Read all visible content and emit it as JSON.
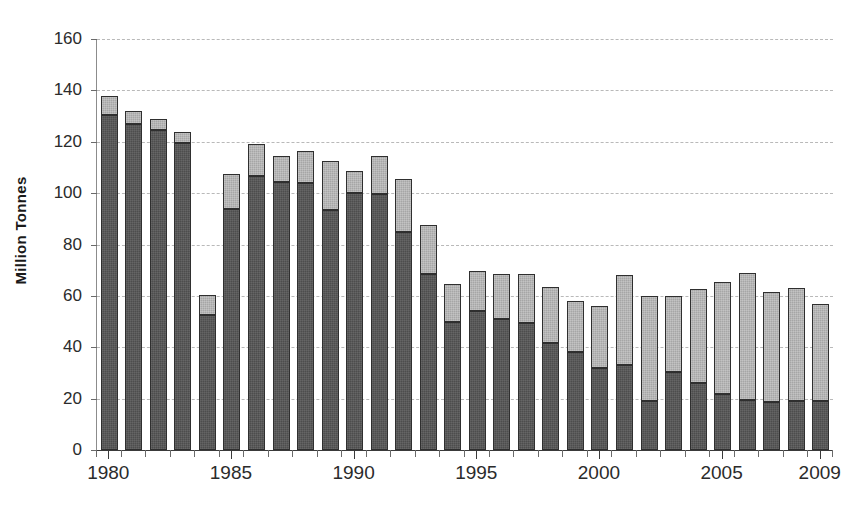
{
  "chart_data": {
    "type": "bar",
    "stacked": true,
    "title": "",
    "subtitle": "",
    "xlabel": "",
    "ylabel": "Million Tonnes",
    "ylim": [
      0,
      160
    ],
    "ytick_step": 20,
    "ytick_labels": [
      "0",
      "20",
      "40",
      "60",
      "80",
      "100",
      "120",
      "140",
      "160"
    ],
    "grid": true,
    "grid_axis": "y",
    "legend": null,
    "legend_position": "none",
    "xlim_categories": 30,
    "categories": [
      "1980",
      "1981",
      "1982",
      "1983",
      "1984",
      "1985",
      "1986",
      "1987",
      "1988",
      "1989",
      "1990",
      "1991",
      "1992",
      "1993",
      "1994",
      "1995",
      "1996",
      "1997",
      "1998",
      "1999",
      "2000",
      "2001",
      "2002",
      "2003",
      "2004",
      "2005",
      "2006",
      "2007",
      "2008",
      "2009"
    ],
    "xtick_labels_shown": [
      "1980",
      "1985",
      "1990",
      "1995",
      "2000",
      "2005",
      "2009"
    ],
    "series": [
      {
        "name": "lower-segment",
        "color": "#4d4d4d",
        "values": [
          130.5,
          127.0,
          124.5,
          119.5,
          52.5,
          94.0,
          106.5,
          104.5,
          104.0,
          93.5,
          100.0,
          99.5,
          85.0,
          68.5,
          50.0,
          54.0,
          51.0,
          49.5,
          41.5,
          38.0,
          32.0,
          33.0,
          19.0,
          30.5,
          26.0,
          22.0,
          19.5,
          18.5,
          19.0,
          19.0
        ]
      },
      {
        "name": "upper-segment",
        "color": "#a6a6a6",
        "values": [
          7.3,
          5.0,
          4.5,
          4.5,
          8.0,
          13.5,
          12.5,
          10.0,
          12.5,
          19.0,
          8.5,
          15.0,
          20.5,
          19.0,
          14.5,
          15.5,
          17.5,
          19.0,
          22.0,
          20.0,
          24.0,
          35.0,
          41.0,
          29.5,
          36.5,
          43.5,
          49.5,
          43.0,
          44.0,
          38.0
        ]
      }
    ],
    "totals": [
      137.8,
      132.0,
      129.0,
      124.0,
      60.5,
      107.5,
      119.0,
      114.5,
      116.5,
      112.5,
      108.5,
      114.5,
      105.5,
      87.5,
      64.5,
      69.5,
      68.5,
      68.5,
      63.5,
      58.0,
      56.0,
      68.0,
      60.0,
      60.0,
      62.0,
      65.5,
      69.0,
      61.5,
      63.0,
      57.0
    ],
    "colors": {
      "lower": "#4d4d4d",
      "upper": "#a6a6a6",
      "gridline": "#b9b9b9",
      "axis": "#3a3a3a",
      "text": "#2b2b2b"
    }
  },
  "axis": {
    "y_title": "Million Tonnes"
  }
}
